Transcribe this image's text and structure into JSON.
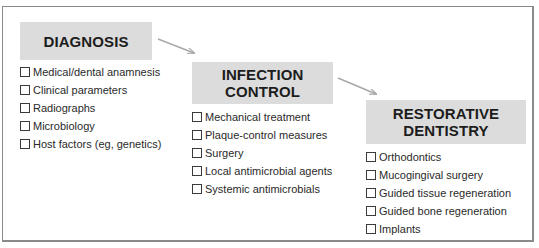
{
  "diagram": {
    "stages": [
      {
        "title_lines": [
          "DIAGNOSIS"
        ],
        "items": [
          "Medical/dental anamnesis",
          "Clinical parameters",
          "Radiographs",
          "Microbiology",
          "Host factors (eg, genetics)"
        ]
      },
      {
        "title_lines": [
          "INFECTION",
          "CONTROL"
        ],
        "items": [
          "Mechanical treatment",
          "Plaque-control measures",
          "Surgery",
          "Local antimicrobial agents",
          "Systemic antimicrobials"
        ]
      },
      {
        "title_lines": [
          "RESTORATIVE",
          "DENTISTRY"
        ],
        "items": [
          "Orthodontics",
          "Mucogingival surgery",
          "Guided tissue regeneration",
          "Guided bone regeneration",
          "Implants"
        ]
      }
    ],
    "connectors": [
      {
        "from": "DIAGNOSIS",
        "to": "INFECTION CONTROL"
      },
      {
        "from": "INFECTION CONTROL",
        "to": "RESTORATIVE DENTISTRY"
      }
    ],
    "colors": {
      "header_fill": "#dcdcdc",
      "arrow": "#a8a8a8",
      "frame": "#8a8a8a",
      "text": "#1e1e1e"
    }
  }
}
